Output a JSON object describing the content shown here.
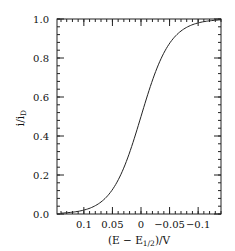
{
  "chart_data": {
    "type": "line",
    "title": "",
    "xlabel": "(E − E1/2)/V",
    "xlabel_parts": {
      "pre": "(E − E",
      "sub": "1/2",
      "post": ")/V"
    },
    "ylabel": "i/iD",
    "ylabel_parts": {
      "pre": "i/i",
      "sub": "D"
    },
    "xlim": [
      0.147,
      -0.14
    ],
    "ylim": [
      0.0,
      1.0
    ],
    "x_reversed": true,
    "grid": false,
    "legend": null,
    "xticks": [
      0.1,
      0.05,
      0,
      -0.05,
      -0.1
    ],
    "xtick_labels": [
      "0.1",
      "0.05",
      "0",
      "−0.05",
      "−0.1"
    ],
    "x_minor_step": 0.01,
    "yticks": [
      0.0,
      0.2,
      0.4,
      0.6,
      0.8,
      1.0
    ],
    "ytick_labels": [
      "0.0",
      "0.2",
      "0.4",
      "0.6",
      "0.8",
      "1.0"
    ],
    "y_minor_step": 0.04,
    "series": [
      {
        "name": "sigmoidal voltammogram",
        "color": "#222222",
        "x": [
          0.14,
          0.12,
          0.1,
          0.09,
          0.08,
          0.07,
          0.06,
          0.05,
          0.04,
          0.03,
          0.02,
          0.01,
          0.0,
          -0.01,
          -0.02,
          -0.03,
          -0.04,
          -0.05,
          -0.06,
          -0.07,
          -0.08,
          -0.09,
          -0.1,
          -0.12,
          -0.14
        ],
        "y": [
          0.004,
          0.009,
          0.02,
          0.029,
          0.043,
          0.062,
          0.088,
          0.125,
          0.174,
          0.237,
          0.314,
          0.404,
          0.5,
          0.596,
          0.686,
          0.763,
          0.826,
          0.875,
          0.912,
          0.938,
          0.957,
          0.971,
          0.98,
          0.991,
          0.996
        ]
      }
    ]
  }
}
